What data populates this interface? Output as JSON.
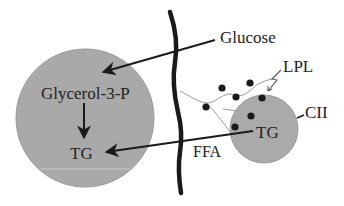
{
  "diagram": {
    "labels": {
      "glucose": "Glucose",
      "glycerol3p": "Glycerol-3-P",
      "tg_cell": "TG",
      "tg_lipoprotein": "TG",
      "lpl": "LPL",
      "cii": "CII",
      "ffa": "FFA"
    },
    "colors": {
      "cell_fill": "#a9a9a9",
      "lipoprotein_fill": "#aaaaaa",
      "ink": "#1a1a1a",
      "thin_line": "#9a9a9a",
      "background": "#ffffff"
    },
    "components": [
      {
        "id": "adipocyte",
        "type": "large-circle",
        "contains": [
          "Glycerol-3-P",
          "TG"
        ]
      },
      {
        "id": "membrane",
        "type": "thick-wavy-line"
      },
      {
        "id": "lipoprotein",
        "type": "small-circle",
        "contains": [
          "TG"
        ],
        "surface_label": "CII"
      },
      {
        "id": "lpl-enzyme",
        "type": "dots-on-strands",
        "label": "LPL"
      }
    ],
    "arrows": [
      {
        "from": "Glucose",
        "to": "Glycerol-3-P"
      },
      {
        "from": "Glycerol-3-P",
        "to": "TG"
      },
      {
        "from": "TG (lipoprotein)",
        "to": "TG (cell)",
        "label": "FFA"
      }
    ]
  }
}
